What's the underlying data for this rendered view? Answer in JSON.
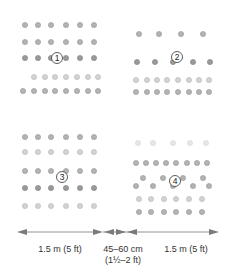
{
  "diagram": {
    "colors": {
      "dot_dark": "#8c8c8c",
      "dot_mid": "#a8a8a8",
      "dot_light": "#cfcfcf",
      "arrow": "#7a7a7a",
      "text": "#333333"
    },
    "beds": [
      {
        "id": "bed-1",
        "label": "1",
        "rows": [
          {
            "y": 25,
            "x": [
              25,
              38,
              51,
              66,
              80,
              94
            ],
            "tone": "mid"
          },
          {
            "y": 42,
            "x": [
              25,
              38,
              51,
              66,
              80,
              94
            ],
            "tone": "mid"
          },
          {
            "y": 58,
            "x": [
              25,
              38,
              51,
              66,
              80,
              94
            ],
            "tone": "dark"
          },
          {
            "y": 77,
            "x": [
              34,
              45,
              55,
              66,
              77,
              88,
              98
            ],
            "tone": "light"
          },
          {
            "y": 91,
            "x": [
              23,
              34,
              45,
              55,
              66,
              77,
              88,
              98
            ],
            "tone": "mid"
          }
        ],
        "marker": {
          "x": 57,
          "y": 58
        }
      },
      {
        "id": "bed-2",
        "label": "2",
        "rows": [
          {
            "y": 34,
            "x": [
              139,
              159,
              181,
              203
            ],
            "tone": "mid"
          },
          {
            "y": 62,
            "x": [
              137,
              155,
              173,
              193,
              210
            ],
            "tone": "dark"
          },
          {
            "y": 80,
            "x": [
              136,
              147,
              157,
              167,
              178,
              189,
              199,
              209
            ],
            "tone": "light"
          },
          {
            "y": 92,
            "x": [
              136,
              147,
              157,
              167,
              178,
              189,
              199,
              209
            ],
            "tone": "mid"
          }
        ],
        "marker": {
          "x": 177,
          "y": 57
        }
      },
      {
        "id": "bed-3",
        "label": "3",
        "rows": [
          {
            "y": 137,
            "x": [
              25,
              38,
              51,
              66,
              80,
              94
            ],
            "tone": "mid"
          },
          {
            "y": 152,
            "x": [
              25,
              38,
              51,
              66,
              80,
              94
            ],
            "tone": "light"
          },
          {
            "y": 171,
            "x": [
              25,
              38,
              51,
              66,
              80,
              94
            ],
            "tone": "mid"
          },
          {
            "y": 188,
            "x": [
              25,
              38,
              51,
              66,
              80,
              94
            ],
            "tone": "dark"
          },
          {
            "y": 206,
            "x": [
              25,
              38,
              51,
              66,
              80,
              94
            ],
            "tone": "light"
          }
        ],
        "marker": {
          "x": 62,
          "y": 177
        }
      },
      {
        "id": "bed-4",
        "label": "4",
        "rows": [
          {
            "y": 143,
            "x": [
              138,
              153,
              173,
              190,
              206
            ],
            "tone": "faint"
          },
          {
            "y": 163,
            "x": [
              136,
              146,
              156,
              166,
              176,
              187,
              197,
              207
            ],
            "tone": "mid"
          },
          {
            "y": 178,
            "x": [
              143,
              163,
              183,
              203
            ],
            "tone": "mid"
          },
          {
            "y": 186,
            "x": [
              136,
              153,
              173,
              193,
              209
            ],
            "tone": "mid"
          },
          {
            "y": 199,
            "x": [
              139,
              151,
              164,
              176,
              189,
              202
            ],
            "tone": "light"
          },
          {
            "y": 212,
            "x": [
              139,
              151,
              164,
              176,
              189,
              202
            ],
            "tone": "mid"
          }
        ],
        "marker": {
          "x": 175,
          "y": 181
        }
      }
    ],
    "measurements": [
      {
        "id": "left-width",
        "label": "1.5 m (5 ft)",
        "sublabel": ""
      },
      {
        "id": "gap",
        "label": "45–60 cm",
        "sublabel": "(1½–2 ft)"
      },
      {
        "id": "right-width",
        "label": "1.5 m (5 ft)",
        "sublabel": ""
      }
    ]
  }
}
